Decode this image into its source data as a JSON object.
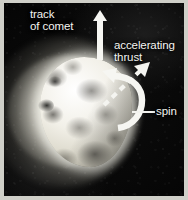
{
  "figure": {
    "kind": "comet-nucleus-diagram",
    "border_color": "#cfcfc8",
    "background_color": "#050505",
    "nucleus_color": "#f2f0e8",
    "annotation_color": "#f4f4f0"
  },
  "annotations": {
    "track": {
      "line1": "track",
      "line2": "of comet",
      "arrow": "up-arrow-icon",
      "arrow_style": "solid"
    },
    "thrust": {
      "line1": "accelerating",
      "line2": "thrust",
      "arrow": "diagonal-dashed-arrow-icon",
      "arrow_style": "dashed"
    },
    "spin": {
      "label": "spin",
      "arrow": "curved-rotation-arrow-icon",
      "arrow_style": "curved",
      "leader": "leader-line"
    }
  }
}
